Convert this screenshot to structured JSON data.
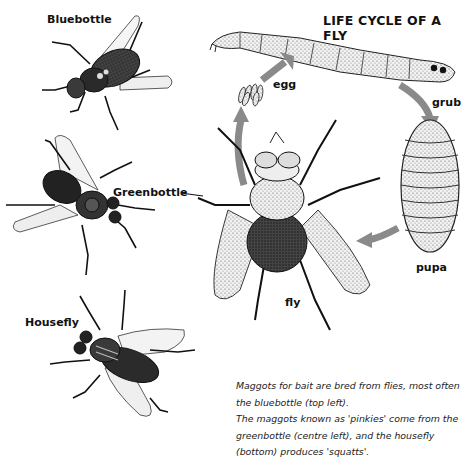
{
  "title": "LIFE CYCLE OF A FLY",
  "species": {
    "bluebottle": "Bluebottle",
    "greenbottle": "Greenbottle",
    "housefly": "Housefly"
  },
  "cycle": {
    "stages": [
      "egg",
      "grub",
      "pupa",
      "fly"
    ],
    "egg": "egg",
    "grub": "grub",
    "pupa": "pupa",
    "fly": "fly",
    "arrow_color": "#8a8a8a"
  },
  "caption": {
    "line1": "Maggots for bait are bred from flies, most often",
    "line2": "the bluebottle (top left).",
    "line3": "The maggots known as 'pinkies' come from the",
    "line4": "greenbottle (centre left), and the housefly",
    "line5": "(bottom) produces 'squatts'."
  }
}
